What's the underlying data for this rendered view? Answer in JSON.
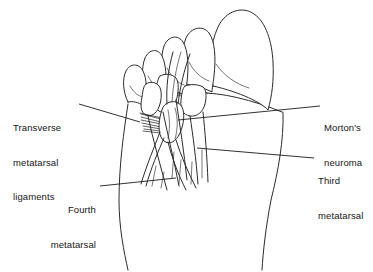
{
  "figure": {
    "background_color": "#ffffff",
    "line_color": "#2b2b2b",
    "width": 373,
    "height": 272,
    "view": "plantar view of right foot showing metatarsals, nerves and transverse metatarsal ligaments"
  },
  "callouts": [
    {
      "id": "transverse-metatarsal-ligaments",
      "lines": [
        "Transverse",
        "metatarsal",
        "ligaments"
      ],
      "align": "left",
      "side": "left"
    },
    {
      "id": "fourth-metatarsal",
      "lines": [
        "Fourth",
        "metatarsal"
      ],
      "align": "right",
      "side": "left"
    },
    {
      "id": "mortons-neuroma",
      "lines": [
        "Morton's",
        "neuroma"
      ],
      "align": "left",
      "side": "right"
    },
    {
      "id": "third-metatarsal",
      "lines": [
        "Third",
        "metatarsal"
      ],
      "align": "left",
      "side": "right"
    }
  ],
  "labels": {
    "transverse": {
      "line1": "Transverse",
      "line2": "metatarsal",
      "line3": "ligaments"
    },
    "fourth": {
      "line1": "Fourth",
      "line2": "metatarsal"
    },
    "mortons": {
      "line1": "Morton's",
      "line2": "neuroma"
    },
    "third": {
      "line1": "Third",
      "line2": "metatarsal"
    }
  }
}
